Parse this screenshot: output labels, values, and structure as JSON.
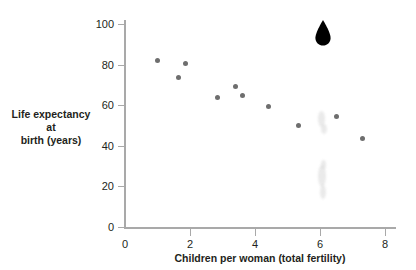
{
  "chart_data": {
    "type": "scatter",
    "title": "",
    "xlabel": "Children per woman (total fertility)",
    "ylabel_line1": "Life expectancy at",
    "ylabel_line2": "birth (years)",
    "xlim": [
      0,
      8.6
    ],
    "ylim": [
      0,
      105
    ],
    "xticks": [
      0,
      2,
      4,
      6,
      8
    ],
    "xtick_labels": [
      "0",
      "2",
      "4",
      "6",
      "8"
    ],
    "yticks": [
      0,
      20,
      40,
      60,
      80,
      100
    ],
    "ytick_labels": [
      "0",
      "20",
      "40",
      "60",
      "80",
      "100"
    ],
    "grid": false,
    "legend": "none",
    "point_color": "#6e6e6e",
    "highlight_color": "#000000",
    "axis_color": "#a9a9a9",
    "text_color": "#231f20",
    "series": [
      {
        "name": "countries",
        "points": [
          {
            "x": 1.0,
            "y": 82.0
          },
          {
            "x": 1.65,
            "y": 73.5
          },
          {
            "x": 1.85,
            "y": 80.5
          },
          {
            "x": 2.85,
            "y": 64.0
          },
          {
            "x": 3.4,
            "y": 69.0
          },
          {
            "x": 3.6,
            "y": 65.0
          },
          {
            "x": 4.4,
            "y": 59.5
          },
          {
            "x": 5.35,
            "y": 50.0
          },
          {
            "x": 6.5,
            "y": 54.5
          },
          {
            "x": 7.3,
            "y": 43.5
          }
        ]
      }
    ],
    "highlight_marker": {
      "name": "teardrop-pin-marker",
      "x": 6.1,
      "y": 92.0
    },
    "artifacts": [
      {
        "x": 6.05,
        "y": 53.0,
        "w": 7,
        "h": 16
      },
      {
        "x": 6.12,
        "y": 48.5,
        "w": 6,
        "h": 10
      },
      {
        "x": 6.05,
        "y": 25.0,
        "w": 8,
        "h": 22
      },
      {
        "x": 6.08,
        "y": 17.0,
        "w": 6,
        "h": 14
      },
      {
        "x": 6.1,
        "y": 31.0,
        "w": 5,
        "h": 9
      }
    ]
  }
}
